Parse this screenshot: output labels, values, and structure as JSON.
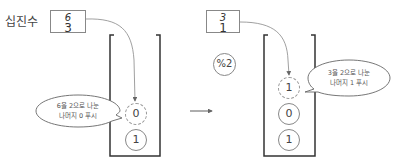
{
  "diagram": {
    "label": "십진수",
    "step1": {
      "box": {
        "struck": "6",
        "value": "3"
      },
      "stack": [
        {
          "value": "0",
          "style": "dashed",
          "state": "new"
        },
        {
          "value": "1",
          "style": "solid"
        }
      ],
      "bubble": {
        "line1": "6을 2으로 나눈",
        "line2": "나머지 0 푸시"
      }
    },
    "transition": {
      "arrow": "→"
    },
    "step2": {
      "box": {
        "struck": "3",
        "value": "1"
      },
      "operator": "%2",
      "stack": [
        {
          "value": "1",
          "style": "dashed",
          "state": "new"
        },
        {
          "value": "0",
          "style": "solid"
        },
        {
          "value": "1",
          "style": "solid"
        }
      ],
      "bubble": {
        "line1": "3을 2으로 나눈",
        "line2": "나머지 1 푸시"
      }
    },
    "colors": {
      "line": "#888888",
      "container": "#333333",
      "text": "#444444"
    }
  }
}
